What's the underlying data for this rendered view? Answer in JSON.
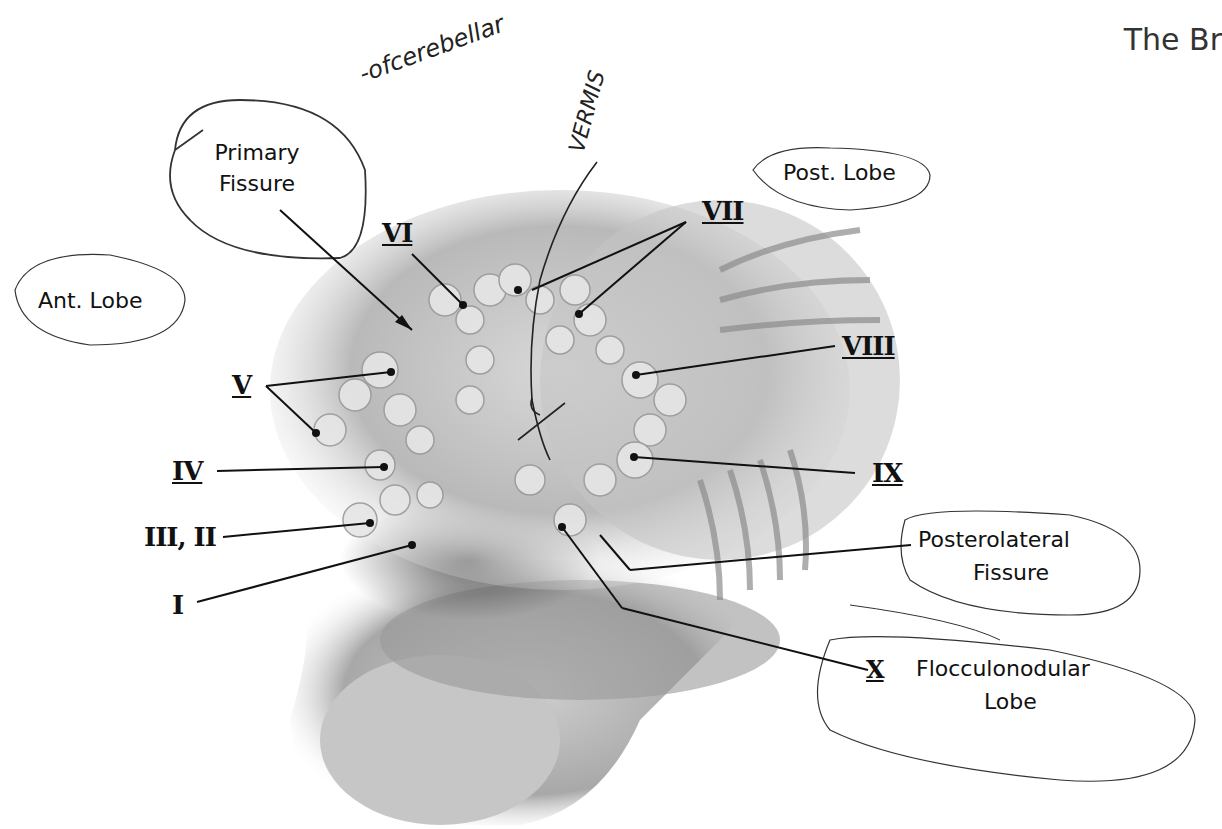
{
  "header": {
    "title": "The Br"
  },
  "figure": {
    "labels": {
      "primary_fissure": [
        "Primary",
        "Fissure"
      ],
      "ant_lobe": "Ant. Lobe",
      "post_lobe": "Post. Lobe",
      "posterolateral_fissure": [
        "Posterolateral",
        "Fissure"
      ],
      "flocculonodular_lobe": [
        "Flocculonodular",
        "Lobe"
      ],
      "lobules": {
        "I": "I",
        "II_III": "III, II",
        "IV": "IV",
        "V": "V",
        "VI": "VI",
        "VII": "VII",
        "VIII": "VIII",
        "IX": "IX",
        "X": "X"
      }
    },
    "handwritten": {
      "of_cerebellum": "-ofcerebellar",
      "vermis": "VERMIS"
    }
  }
}
